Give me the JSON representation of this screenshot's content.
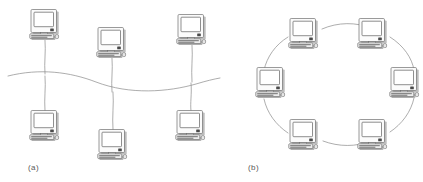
{
  "figure": {
    "background_color": "#ffffff",
    "line_color": "#8a8a8a",
    "caption_color": "#5a5a5a",
    "panels": [
      {
        "id": "a",
        "caption": "(a)",
        "topology": "bus",
        "caption_x": 28,
        "caption_y": 170,
        "node_count": 6
      },
      {
        "id": "b",
        "caption": "(b)",
        "topology": "ring",
        "caption_x": 248,
        "caption_y": 170,
        "node_count": 6
      }
    ],
    "bus": {
      "path": "M 8 76 C 40 68 70 72 96 82 C 130 95 168 92 196 84 C 206 81 214 79 220 78",
      "drops": [
        {
          "id": "drop-top-left",
          "path": "M 45 40 C 46 52 44 62 45 74"
        },
        {
          "id": "drop-top-middle",
          "path": "M 112 58 C 113 70 111 80 112 92"
        },
        {
          "id": "drop-top-right",
          "path": "M 192 45 C 193 58 191 68 192 82"
        },
        {
          "id": "drop-bottom-left",
          "path": "M 45 76 C 46 88 44 98 45 111"
        },
        {
          "id": "drop-bottom-mid",
          "path": "M 113 92 C 114 104 112 116 113 130"
        },
        {
          "id": "drop-bottom-right",
          "path": "M 191 83 C 192 95 190 102 191 111"
        }
      ],
      "nodes": [
        {
          "id": "bus-node-1",
          "label": "computer-top-left",
          "x": 29,
          "y": 9
        },
        {
          "id": "bus-node-2",
          "label": "computer-top-middle",
          "x": 96,
          "y": 27
        },
        {
          "id": "bus-node-3",
          "label": "computer-top-right",
          "x": 176,
          "y": 14
        },
        {
          "id": "bus-node-4",
          "label": "computer-bottom-left",
          "x": 29,
          "y": 110
        },
        {
          "id": "bus-node-5",
          "label": "computer-bottom-middle",
          "x": 97,
          "y": 129
        },
        {
          "id": "bus-node-6",
          "label": "computer-bottom-right",
          "x": 175,
          "y": 110
        }
      ]
    },
    "ring": {
      "arcs": [
        {
          "id": "ring-arc-top",
          "path": "M 322 29 C 338 22 356 22 371 28"
        },
        {
          "id": "ring-arc-top-right",
          "path": "M 390 37 C 404 46 412 58 414 70"
        },
        {
          "id": "ring-arc-bottom-right",
          "path": "M 414 98 C 411 112 402 124 390 132"
        },
        {
          "id": "ring-arc-bottom",
          "path": "M 371 141 C 356 147 339 147 323 141"
        },
        {
          "id": "ring-arc-bottom-left",
          "path": "M 288 133 C 276 125 267 113 264 99"
        },
        {
          "id": "ring-arc-top-left",
          "path": "M 264 70 C 267 57 275 45 288 37"
        }
      ],
      "nodes": [
        {
          "id": "ring-node-1",
          "label": "computer-ring-top-left",
          "x": 288,
          "y": 18
        },
        {
          "id": "ring-node-2",
          "label": "computer-ring-top-right",
          "x": 357,
          "y": 18
        },
        {
          "id": "ring-node-3",
          "label": "computer-ring-right",
          "x": 389,
          "y": 67
        },
        {
          "id": "ring-node-4",
          "label": "computer-ring-bottom-right",
          "x": 357,
          "y": 119
        },
        {
          "id": "ring-node-5",
          "label": "computer-ring-bottom-left",
          "x": 288,
          "y": 119
        },
        {
          "id": "ring-node-6",
          "label": "computer-ring-left",
          "x": 255,
          "y": 67
        }
      ]
    }
  }
}
